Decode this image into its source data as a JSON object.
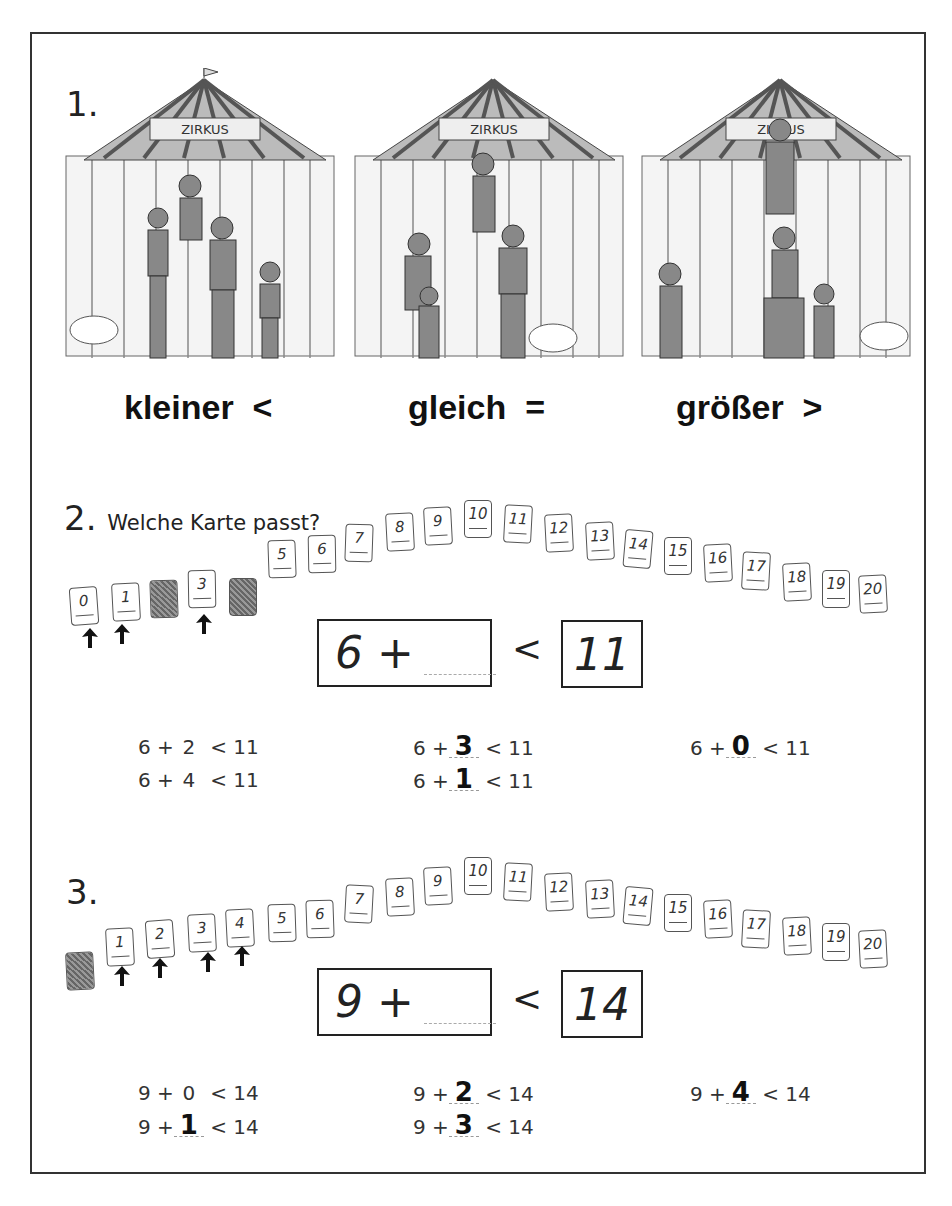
{
  "task1": {
    "number": "1.",
    "scenes": [
      {
        "sign": "ZIRKUS",
        "label": "kleiner",
        "symbol": "<"
      },
      {
        "sign": "ZIRKUS",
        "label": "gleich",
        "symbol": "="
      },
      {
        "sign": "ZIRKUS",
        "label": "größer",
        "symbol": ">"
      }
    ]
  },
  "task2": {
    "number": "2.",
    "instruction": "Welche Karte passt?",
    "cards": [
      "0",
      "1",
      "",
      "3",
      "",
      "5",
      "6",
      "7",
      "8",
      "9",
      "10",
      "11",
      "12",
      "13",
      "14",
      "15",
      "16",
      "17",
      "18",
      "19",
      "20"
    ],
    "hidden_cards": [
      2,
      4
    ],
    "marked_cards": [
      0,
      1,
      3
    ],
    "equation": {
      "left": "6 +",
      "comparator": "<",
      "right": "11"
    },
    "solutions": [
      {
        "prefix": "6 +",
        "value": "2",
        "handwritten": false,
        "suffix": "< 11"
      },
      {
        "prefix": "6 +",
        "value": "4",
        "handwritten": false,
        "suffix": "< 11"
      },
      {
        "prefix": "6 +",
        "value": "3",
        "handwritten": true,
        "suffix": "< 11"
      },
      {
        "prefix": "6 +",
        "value": "1",
        "handwritten": true,
        "suffix": "< 11"
      },
      {
        "prefix": "6 +",
        "value": "0",
        "handwritten": true,
        "suffix": "< 11"
      }
    ]
  },
  "task3": {
    "number": "3.",
    "cards": [
      "",
      "1",
      "2",
      "3",
      "4",
      "5",
      "6",
      "7",
      "8",
      "9",
      "10",
      "11",
      "12",
      "13",
      "14",
      "15",
      "16",
      "17",
      "18",
      "19",
      "20"
    ],
    "hidden_cards": [
      0
    ],
    "marked_cards": [
      1,
      2,
      3,
      4
    ],
    "equation": {
      "left": "9 +",
      "comparator": "<",
      "right": "14"
    },
    "solutions": [
      {
        "prefix": "9 +",
        "value": "0",
        "handwritten": false,
        "suffix": "< 14"
      },
      {
        "prefix": "9 +",
        "value": "1",
        "handwritten": true,
        "suffix": "< 14"
      },
      {
        "prefix": "9 +",
        "value": "2",
        "handwritten": true,
        "suffix": "< 14"
      },
      {
        "prefix": "9 +",
        "value": "3",
        "handwritten": true,
        "suffix": "< 14"
      },
      {
        "prefix": "9 +",
        "value": "4",
        "handwritten": true,
        "suffix": "< 14"
      }
    ]
  }
}
